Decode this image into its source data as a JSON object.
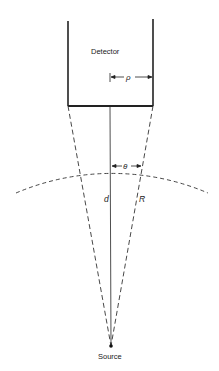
{
  "diagram": {
    "labels": {
      "detector": "Detector",
      "rho": "ρ",
      "theta": "θ",
      "d": "d",
      "R": "R",
      "source": "Source"
    }
  }
}
